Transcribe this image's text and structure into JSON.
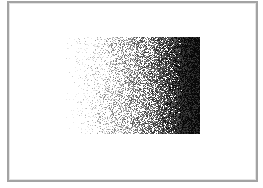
{
  "image": {
    "description": "Stippled / dithered horizontal gradient from white (left) to black (right) inside a thin gray frame",
    "canvas": {
      "width": 263,
      "height": 188,
      "background": "#ffffff"
    },
    "frame": {
      "x": 7,
      "y": 1,
      "width": 251,
      "height": 181,
      "border_color": "#a3a3a3"
    },
    "gradient_region": {
      "x": 72,
      "y": 37,
      "width": 128,
      "height": 97,
      "direction": "left-to-right",
      "start_color": "#ffffff",
      "end_color": "#0a0a0a",
      "ragged_left_edge": true,
      "seed": 1337
    }
  }
}
